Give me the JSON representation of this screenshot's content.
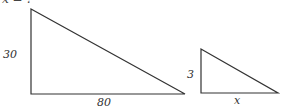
{
  "caption": {
    "text": "x = ?"
  },
  "diagram": {
    "stroke_color": "#333333",
    "large_triangle": {
      "height_label": "30",
      "base_label": "80"
    },
    "small_triangle": {
      "height_label": "3",
      "base_label": "x"
    }
  }
}
